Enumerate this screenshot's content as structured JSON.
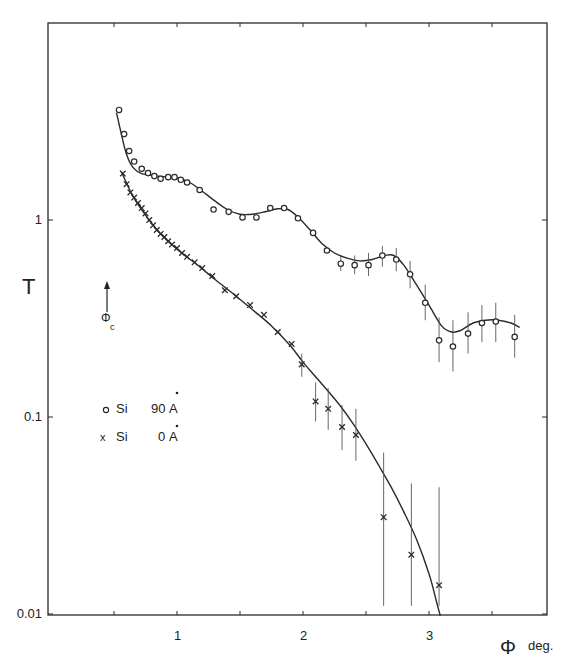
{
  "chart_data": {
    "type": "scatter",
    "title": "",
    "xlabel": "Φ deg.",
    "ylabel": "T",
    "xscale": "linear",
    "yscale": "log",
    "xlim": [
      0,
      3.9
    ],
    "ylim": [
      0.01,
      10
    ],
    "grid": false,
    "x_ticks": [
      0.5,
      1,
      1.5,
      2,
      2.5,
      3,
      3.5
    ],
    "x_tick_labels": [
      {
        "value": 1,
        "label": "1"
      },
      {
        "value": 2,
        "label": "2"
      },
      {
        "value": 3,
        "label": "3"
      }
    ],
    "y_tick_labels": [
      {
        "value": 1,
        "label": "1"
      },
      {
        "value": 0.1,
        "label": "0.1"
      },
      {
        "value": 0.01,
        "label": "0.01"
      }
    ],
    "annotations": [
      {
        "text": "Φc",
        "type": "arrow-up",
        "x": 0.51,
        "y": 0.28,
        "description": "critical angle marker arrow"
      }
    ],
    "legend": {
      "position": "upper-left-inside",
      "entries": [
        {
          "marker": "o",
          "label": "Si",
          "thickness": "90Å"
        },
        {
          "marker": "x",
          "label": "Si",
          "thickness": "0Å"
        }
      ]
    },
    "series": [
      {
        "name": "Si 90Å",
        "marker": "o",
        "points": [
          {
            "x": 0.54,
            "y": 3.62
          },
          {
            "x": 0.58,
            "y": 2.73
          },
          {
            "x": 0.62,
            "y": 2.24
          },
          {
            "x": 0.66,
            "y": 1.98
          },
          {
            "x": 0.72,
            "y": 1.82
          },
          {
            "x": 0.77,
            "y": 1.73
          },
          {
            "x": 0.82,
            "y": 1.67
          },
          {
            "x": 0.87,
            "y": 1.62
          },
          {
            "x": 0.93,
            "y": 1.65
          },
          {
            "x": 0.98,
            "y": 1.65
          },
          {
            "x": 1.03,
            "y": 1.6
          },
          {
            "x": 1.08,
            "y": 1.55
          },
          {
            "x": 1.18,
            "y": 1.42
          },
          {
            "x": 1.29,
            "y": 1.13
          },
          {
            "x": 1.41,
            "y": 1.1
          },
          {
            "x": 1.52,
            "y": 1.03
          },
          {
            "x": 1.63,
            "y": 1.03
          },
          {
            "x": 1.74,
            "y": 1.15
          },
          {
            "x": 1.85,
            "y": 1.15
          },
          {
            "x": 1.96,
            "y": 1.02
          },
          {
            "x": 2.08,
            "y": 0.86
          },
          {
            "x": 2.19,
            "y": 0.7
          },
          {
            "x": 2.3,
            "y": 0.6,
            "err": [
              0.55,
              0.66
            ]
          },
          {
            "x": 2.41,
            "y": 0.59,
            "err": [
              0.53,
              0.66
            ]
          },
          {
            "x": 2.52,
            "y": 0.59,
            "err": [
              0.52,
              0.68
            ]
          },
          {
            "x": 2.63,
            "y": 0.66,
            "err": [
              0.58,
              0.74
            ]
          },
          {
            "x": 2.74,
            "y": 0.63,
            "err": [
              0.55,
              0.72
            ]
          },
          {
            "x": 2.85,
            "y": 0.53,
            "err": [
              0.45,
              0.62
            ]
          },
          {
            "x": 2.97,
            "y": 0.38,
            "err": [
              0.31,
              0.47
            ]
          },
          {
            "x": 3.08,
            "y": 0.245,
            "err": [
              0.19,
              0.32
            ]
          },
          {
            "x": 3.19,
            "y": 0.228,
            "err": [
              0.17,
              0.31
            ]
          },
          {
            "x": 3.31,
            "y": 0.265,
            "err": [
              0.21,
              0.34
            ]
          },
          {
            "x": 3.42,
            "y": 0.3,
            "err": [
              0.24,
              0.37
            ]
          },
          {
            "x": 3.53,
            "y": 0.305,
            "err": [
              0.24,
              0.38
            ]
          },
          {
            "x": 3.68,
            "y": 0.255,
            "err": [
              0.2,
              0.33
            ]
          }
        ],
        "fit_curve": [
          [
            0.52,
            3.5
          ],
          [
            0.56,
            2.7
          ],
          [
            0.6,
            2.15
          ],
          [
            0.65,
            1.85
          ],
          [
            0.72,
            1.72
          ],
          [
            0.85,
            1.67
          ],
          [
            1.0,
            1.63
          ],
          [
            1.1,
            1.55
          ],
          [
            1.2,
            1.4
          ],
          [
            1.3,
            1.25
          ],
          [
            1.4,
            1.13
          ],
          [
            1.5,
            1.07
          ],
          [
            1.6,
            1.07
          ],
          [
            1.7,
            1.1
          ],
          [
            1.8,
            1.14
          ],
          [
            1.88,
            1.13
          ],
          [
            1.95,
            1.05
          ],
          [
            2.05,
            0.9
          ],
          [
            2.15,
            0.76
          ],
          [
            2.25,
            0.68
          ],
          [
            2.35,
            0.64
          ],
          [
            2.45,
            0.62
          ],
          [
            2.55,
            0.63
          ],
          [
            2.65,
            0.66
          ],
          [
            2.72,
            0.66
          ],
          [
            2.8,
            0.59
          ],
          [
            2.9,
            0.47
          ],
          [
            3.0,
            0.37
          ],
          [
            3.1,
            0.29
          ],
          [
            3.18,
            0.27
          ],
          [
            3.25,
            0.275
          ],
          [
            3.35,
            0.3
          ],
          [
            3.45,
            0.31
          ],
          [
            3.55,
            0.31
          ],
          [
            3.65,
            0.3
          ],
          [
            3.72,
            0.285
          ]
        ]
      },
      {
        "name": "Si 0Å",
        "marker": "x",
        "points": [
          {
            "x": 0.57,
            "y": 1.72
          },
          {
            "x": 0.6,
            "y": 1.52
          },
          {
            "x": 0.63,
            "y": 1.38
          },
          {
            "x": 0.66,
            "y": 1.3
          },
          {
            "x": 0.69,
            "y": 1.22
          },
          {
            "x": 0.72,
            "y": 1.15
          },
          {
            "x": 0.75,
            "y": 1.08
          },
          {
            "x": 0.78,
            "y": 1.0
          },
          {
            "x": 0.81,
            "y": 0.94
          },
          {
            "x": 0.84,
            "y": 0.89
          },
          {
            "x": 0.87,
            "y": 0.85
          },
          {
            "x": 0.9,
            "y": 0.82
          },
          {
            "x": 0.93,
            "y": 0.78
          },
          {
            "x": 0.96,
            "y": 0.75
          },
          {
            "x": 1.0,
            "y": 0.72
          },
          {
            "x": 1.04,
            "y": 0.68
          },
          {
            "x": 1.08,
            "y": 0.65
          },
          {
            "x": 1.14,
            "y": 0.61
          },
          {
            "x": 1.2,
            "y": 0.57
          },
          {
            "x": 1.28,
            "y": 0.52
          },
          {
            "x": 1.38,
            "y": 0.44
          },
          {
            "x": 1.47,
            "y": 0.41
          },
          {
            "x": 1.58,
            "y": 0.37
          },
          {
            "x": 1.69,
            "y": 0.33
          },
          {
            "x": 1.8,
            "y": 0.27
          },
          {
            "x": 1.91,
            "y": 0.235
          },
          {
            "x": 1.99,
            "y": 0.185,
            "err": [
              0.16,
              0.21
            ]
          },
          {
            "x": 2.1,
            "y": 0.12,
            "err": [
              0.095,
              0.15
            ]
          },
          {
            "x": 2.2,
            "y": 0.11,
            "err": [
              0.086,
              0.14
            ]
          },
          {
            "x": 2.31,
            "y": 0.089,
            "err": [
              0.068,
              0.115
            ]
          },
          {
            "x": 2.42,
            "y": 0.081,
            "err": [
              0.06,
              0.11
            ]
          },
          {
            "x": 2.64,
            "y": 0.031,
            "err": [
              0.011,
              0.066
            ]
          },
          {
            "x": 2.86,
            "y": 0.02,
            "err": [
              0.011,
              0.046
            ]
          },
          {
            "x": 3.08,
            "y": 0.014,
            "err": [
              0.011,
              0.044
            ]
          }
        ],
        "fit_curve": [
          [
            0.56,
            1.75
          ],
          [
            0.65,
            1.32
          ],
          [
            0.75,
            1.06
          ],
          [
            0.85,
            0.88
          ],
          [
            1.0,
            0.71
          ],
          [
            1.15,
            0.6
          ],
          [
            1.3,
            0.5
          ],
          [
            1.45,
            0.42
          ],
          [
            1.6,
            0.35
          ],
          [
            1.75,
            0.29
          ],
          [
            1.9,
            0.23
          ],
          [
            2.0,
            0.19
          ],
          [
            2.1,
            0.16
          ],
          [
            2.2,
            0.135
          ],
          [
            2.3,
            0.113
          ],
          [
            2.4,
            0.092
          ],
          [
            2.5,
            0.073
          ],
          [
            2.6,
            0.057
          ],
          [
            2.7,
            0.044
          ],
          [
            2.8,
            0.033
          ],
          [
            2.9,
            0.024
          ],
          [
            3.0,
            0.016
          ],
          [
            3.06,
            0.0115
          ],
          [
            3.09,
            0.0098
          ]
        ]
      }
    ]
  },
  "labels": {
    "y_axis": "T",
    "x_axis_symbol": "Φ",
    "x_axis_unit": "deg.",
    "phi_c": "Φ",
    "phi_c_sub": "c",
    "legend_1_label": "Si",
    "legend_1_value": "90",
    "legend_2_label": "Si",
    "legend_2_value": "0",
    "angstrom": "A"
  }
}
